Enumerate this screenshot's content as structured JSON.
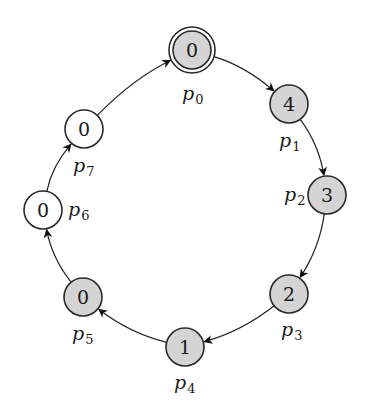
{
  "diagram": {
    "type": "ring",
    "direction": "clockwise",
    "colors": {
      "shaded_fill": "#d4d4d4",
      "plain_fill": "#ffffff",
      "stroke": "#2a2a2a"
    },
    "nodes": [
      {
        "id": "p0",
        "label_base": "p",
        "label_sub": "0",
        "value": "0",
        "shaded": true,
        "double_circle": true,
        "cx": 192,
        "cy": 50,
        "label_x": 182,
        "label_y": 100
      },
      {
        "id": "p1",
        "label_base": "p",
        "label_sub": "1",
        "value": "4",
        "shaded": true,
        "double_circle": false,
        "cx": 289,
        "cy": 104,
        "label_x": 279,
        "label_y": 147
      },
      {
        "id": "p2",
        "label_base": "p",
        "label_sub": "2",
        "value": "3",
        "shaded": true,
        "double_circle": false,
        "cx": 327,
        "cy": 195,
        "label_x": 284,
        "label_y": 201
      },
      {
        "id": "p3",
        "label_base": "p",
        "label_sub": "3",
        "value": "2",
        "shaded": true,
        "double_circle": false,
        "cx": 289,
        "cy": 294,
        "label_x": 281,
        "label_y": 336
      },
      {
        "id": "p4",
        "label_base": "p",
        "label_sub": "4",
        "value": "1",
        "shaded": true,
        "double_circle": false,
        "cx": 185,
        "cy": 347,
        "label_x": 174,
        "label_y": 389
      },
      {
        "id": "p5",
        "label_base": "p",
        "label_sub": "5",
        "value": "0",
        "shaded": true,
        "double_circle": false,
        "cx": 83,
        "cy": 297,
        "label_x": 72,
        "label_y": 340
      },
      {
        "id": "p6",
        "label_base": "p",
        "label_sub": "6",
        "value": "0",
        "shaded": false,
        "double_circle": false,
        "cx": 43,
        "cy": 210,
        "label_x": 68,
        "label_y": 216
      },
      {
        "id": "p7",
        "label_base": "p",
        "label_sub": "7",
        "value": "0",
        "shaded": false,
        "double_circle": false,
        "cx": 84,
        "cy": 129,
        "label_x": 73,
        "label_y": 172
      }
    ],
    "edges": [
      {
        "from": "p0",
        "to": "p1"
      },
      {
        "from": "p1",
        "to": "p2"
      },
      {
        "from": "p2",
        "to": "p3"
      },
      {
        "from": "p3",
        "to": "p4"
      },
      {
        "from": "p4",
        "to": "p5"
      },
      {
        "from": "p5",
        "to": "p6"
      },
      {
        "from": "p6",
        "to": "p7"
      },
      {
        "from": "p7",
        "to": "p0"
      }
    ],
    "node_radius": 19
  }
}
